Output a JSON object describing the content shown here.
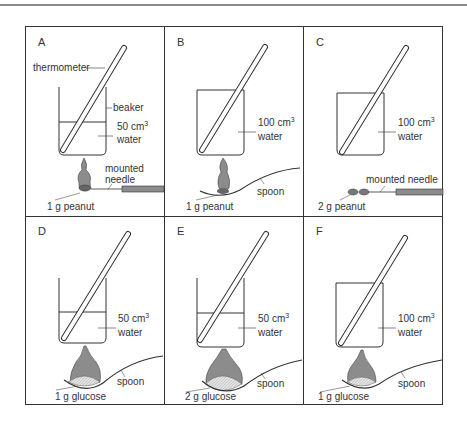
{
  "figure": {
    "panels": [
      {
        "id": "A",
        "water": "50 cm",
        "water2": "water",
        "fuel": "1 g peanut",
        "labels": {
          "thermometer": "thermometer",
          "beaker": "beaker",
          "needle1": "mounted",
          "needle2": "needle"
        }
      },
      {
        "id": "B",
        "water": "100 cm",
        "water2": "water",
        "fuel": "1 g peanut",
        "labels": {
          "spoon": "spoon"
        }
      },
      {
        "id": "C",
        "water": "100 cm",
        "water2": "water",
        "fuel": "2 g peanut",
        "labels": {
          "needle": "mounted needle"
        }
      },
      {
        "id": "D",
        "water": "50 cm",
        "water2": "water",
        "fuel": "1 g glucose",
        "labels": {
          "spoon": "spoon"
        }
      },
      {
        "id": "E",
        "water": "50 cm",
        "water2": "water",
        "fuel": "2 g glucose",
        "labels": {
          "spoon": "spoon"
        }
      },
      {
        "id": "F",
        "water": "100 cm",
        "water2": "water",
        "fuel": "1 g glucose",
        "labels": {
          "spoon": "spoon"
        }
      }
    ],
    "superscript": "3",
    "colors": {
      "line": "#333333",
      "flame": "#8c8c8c",
      "fuel_dark": "#6e6e6e",
      "glucose": "#dcdcdc",
      "needle_handle": "#8c8c8c"
    }
  }
}
